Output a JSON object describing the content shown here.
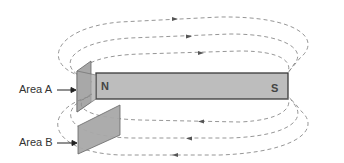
{
  "diagram": {
    "type": "magnetic field of a bar magnet",
    "magnet": {
      "north_label": "N",
      "south_label": "S",
      "fill": "#b8b8b8",
      "stroke": "#444444"
    },
    "areas": [
      {
        "id": "A",
        "label": "Area A",
        "fill": "#a6a6a6"
      },
      {
        "id": "B",
        "label": "Area B",
        "fill": "#a6a6a6"
      }
    ],
    "field_lines": {
      "count_above": 3,
      "count_below": 3,
      "color": "#888888",
      "style": "dashed",
      "arrow_direction_above": "right",
      "arrow_direction_below": "left"
    }
  }
}
